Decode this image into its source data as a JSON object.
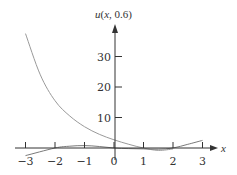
{
  "chart_data": {
    "type": "line",
    "title": "",
    "xlabel": "x",
    "ylabel": "u(x, 0.6)",
    "ylabel_parts": {
      "func": "u",
      "open": "(",
      "var": "x",
      "rest": ", 0.6)"
    },
    "xlim": [
      -3,
      3
    ],
    "ylim": [
      -3,
      40
    ],
    "grid": false,
    "x_ticks": [
      -3,
      -2,
      -1,
      0,
      1,
      2,
      3
    ],
    "x_tick_labels": [
      "−3",
      "−2",
      "−1",
      "0",
      "1",
      "2",
      "3"
    ],
    "y_ticks": [
      10,
      20,
      30
    ],
    "y_tick_labels": [
      "10",
      "20",
      "30"
    ],
    "series": [
      {
        "name": "decaying curve",
        "color": "#9a9a9a",
        "x": [
          -3,
          -2.5,
          -2,
          -1.5,
          -1,
          -0.5,
          0,
          0.5,
          1,
          1.5,
          2
        ],
        "values": [
          37.5,
          24,
          15.5,
          10.5,
          7,
          4.5,
          2.7,
          1.2,
          0,
          -0.8,
          -0.3
        ]
      },
      {
        "name": "oscillating curve",
        "color": "#7a7a7a",
        "x": [
          -3,
          -2,
          -1.5,
          -1,
          -0.5,
          0,
          0.5,
          1,
          1.5,
          2,
          2.5,
          3
        ],
        "values": [
          -2.5,
          0,
          0.6,
          0.8,
          0.5,
          0,
          -0.2,
          -0.3,
          -0.4,
          0,
          1.2,
          2.5
        ]
      }
    ]
  },
  "colors": {
    "axis": "#333333",
    "background": "#ffffff"
  }
}
